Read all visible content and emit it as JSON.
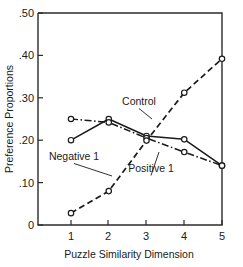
{
  "chart_data": {
    "type": "line",
    "title": "",
    "xlabel": "Puzzle Similarity Dimension",
    "ylabel": "Preference Proportions",
    "x": [
      1,
      2,
      3,
      4,
      5
    ],
    "xtick_labels": [
      "1",
      "2",
      "3",
      "4",
      "5"
    ],
    "ytick_labels": [
      "0",
      ".10",
      ".20",
      ".30",
      ".40",
      ".50"
    ],
    "ytick_values": [
      0,
      0.1,
      0.2,
      0.3,
      0.4,
      0.5
    ],
    "xlim": [
      0.45,
      5.35
    ],
    "ylim": [
      0,
      0.5
    ],
    "grid": false,
    "legend": "inline-annotations",
    "marker": "open-circle",
    "series": [
      {
        "name": "Control",
        "values": [
          0.2,
          0.25,
          0.21,
          0.202,
          0.14
        ],
        "linestyle": "solid",
        "color": "#1a1a1a"
      },
      {
        "name": "Negative 1",
        "values": [
          0.25,
          0.242,
          0.205,
          0.172,
          0.14
        ],
        "linestyle": "dashdot",
        "color": "#1a1a1a"
      },
      {
        "name": "Positive 1",
        "values": [
          0.028,
          0.08,
          0.199,
          0.312,
          0.392
        ],
        "linestyle": "dashed",
        "color": "#1a1a1a"
      }
    ],
    "annotations": [
      {
        "text": "Control",
        "label_x": 139,
        "label_y": 105,
        "leader_to_x": 152,
        "leader_to_y": 119
      },
      {
        "text": "Negative 1",
        "label_x": 74,
        "label_y": 160,
        "leader_to_x": 112,
        "leader_to_y": 176
      },
      {
        "text": "Positive 1",
        "label_x": 151,
        "label_y": 172,
        "leader_to_x": 159,
        "leader_to_y": 152
      }
    ]
  },
  "axes": {
    "y_axis_title": "Preference Proportions",
    "x_axis_title": "Puzzle Similarity Dimension"
  }
}
